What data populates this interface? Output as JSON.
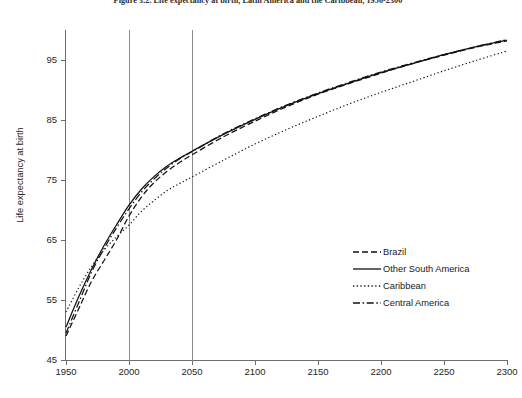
{
  "figure": {
    "title": "Figure 3.2. Life expectancy at birth, Latin America and the Caribbean, 1950-2300",
    "y_axis_title": "Life expectancy at birth"
  },
  "legend": {
    "position": "inside-lower-right",
    "entries": [
      {
        "label": "Brazil",
        "style": "dashed",
        "swatch": "dashed-line-icon"
      },
      {
        "label": "Other South America",
        "style": "solid",
        "swatch": "solid-line-icon"
      },
      {
        "label": "Caribbean",
        "style": "dotted",
        "swatch": "dotted-line-icon"
      },
      {
        "label": "Central America",
        "style": "dash-dot",
        "swatch": "dash-dot-line-icon"
      }
    ]
  },
  "axes": {
    "x_ticks": [
      "1950",
      "2000",
      "2050",
      "2100",
      "2150",
      "2200",
      "2250",
      "2300"
    ],
    "y_ticks": [
      "95",
      "85",
      "75",
      "65",
      "55",
      "45"
    ]
  },
  "chart_data": {
    "type": "line",
    "title": "Figure 3.2. Life expectancy at birth, Latin America and the Caribbean, 1950-2300",
    "xlabel": "",
    "ylabel": "Life expectancy at birth",
    "xlim": [
      1950,
      2300
    ],
    "ylim": [
      45,
      100
    ],
    "xticks": [
      1950,
      2000,
      2050,
      2100,
      2150,
      2200,
      2250,
      2300
    ],
    "yticks": [
      45,
      55,
      65,
      75,
      85,
      95
    ],
    "grid": false,
    "vertical_reference_lines": [
      2000,
      2050
    ],
    "legend_position": "inside-lower-right",
    "x": [
      1950,
      1960,
      1970,
      1980,
      1990,
      2000,
      2010,
      2020,
      2030,
      2040,
      2050,
      2075,
      2100,
      2125,
      2150,
      2175,
      2200,
      2225,
      2250,
      2275,
      2300
    ],
    "series": [
      {
        "name": "Brazil",
        "style": "dashed",
        "values": [
          49.0,
          53.5,
          58.0,
          61.5,
          65.0,
          69.0,
          72.2,
          74.6,
          76.4,
          77.9,
          79.2,
          82.2,
          84.8,
          87.2,
          89.3,
          91.1,
          92.8,
          94.4,
          95.8,
          97.1,
          98.2
        ]
      },
      {
        "name": "Other South America",
        "style": "solid",
        "values": [
          50.5,
          55.5,
          60.0,
          64.0,
          67.5,
          70.8,
          73.5,
          75.6,
          77.3,
          78.6,
          79.8,
          82.6,
          85.1,
          87.4,
          89.4,
          91.2,
          92.9,
          94.4,
          95.9,
          97.2,
          98.3
        ]
      },
      {
        "name": "Caribbean",
        "style": "dotted",
        "values": [
          53.0,
          57.0,
          60.5,
          63.3,
          65.5,
          67.5,
          69.8,
          71.6,
          73.2,
          74.4,
          75.5,
          78.3,
          81.0,
          83.4,
          85.6,
          87.7,
          89.6,
          91.4,
          93.2,
          94.9,
          96.5
        ]
      },
      {
        "name": "Central America",
        "style": "dash-dot",
        "values": [
          49.5,
          54.5,
          59.5,
          63.5,
          67.0,
          70.2,
          73.0,
          75.2,
          77.0,
          78.5,
          79.7,
          82.7,
          85.2,
          87.5,
          89.5,
          91.3,
          93.0,
          94.5,
          95.9,
          97.2,
          98.4
        ]
      }
    ]
  }
}
